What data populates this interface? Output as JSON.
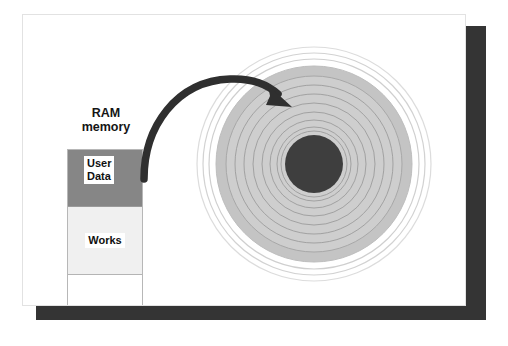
{
  "diagram": {
    "page": {
      "background_color": "#ffffff",
      "shadow_color": "#343434",
      "border_color": "#e2e2e2"
    },
    "ram": {
      "label_line1": "RAM",
      "label_line2": "memory",
      "cells": [
        {
          "name": "user-data",
          "text": "User\nData",
          "fill": "#868686",
          "text_bg": "#ffffff"
        },
        {
          "name": "works",
          "text": "Works",
          "fill": "#f0f0f0",
          "text_bg": "#ffffff"
        },
        {
          "name": "free-space",
          "text": "",
          "fill": "#ffffff",
          "text_bg": "#ffffff"
        }
      ]
    },
    "arrow": {
      "name": "transfer-arrow",
      "color": "#2f2f2f",
      "direction": "ram-to-disk",
      "description": "curved arrow from RAM user data block to disk platter"
    },
    "disk": {
      "name": "disk-platter",
      "center_x": 313,
      "center_y": 163,
      "outer_ring_radius": 117,
      "platter_radius": 98,
      "hub_radius": 29,
      "platter_fill": "#c3c3c3",
      "inner_fill": "#cdcdcd",
      "hub_fill": "#3d3d3d",
      "ring_stroke": "#9a9a9a",
      "outer_ring_stroke": "#d8d8d8",
      "track_count": 8,
      "track_radii": [
        88,
        78,
        68,
        58,
        48,
        39,
        34,
        30
      ]
    }
  }
}
